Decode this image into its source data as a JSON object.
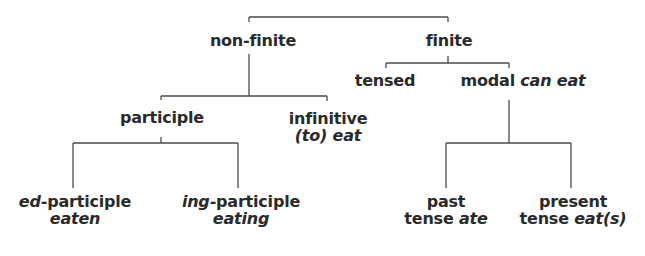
{
  "diagram": {
    "type": "tree",
    "title": "",
    "nodes": {
      "non_finite": {
        "label": "non-finite"
      },
      "finite": {
        "label": "finite"
      },
      "participle": {
        "label": "participle"
      },
      "infinitive": {
        "label": "infinitive",
        "example_prefix": "(to)",
        "example": "eat"
      },
      "ed_participle": {
        "label_italic": "ed",
        "label_rest": "-participle",
        "example": "eaten"
      },
      "ing_participle": {
        "label_italic": "ing",
        "label_rest": "-participle",
        "example": "eating"
      },
      "tensed": {
        "label": "tensed"
      },
      "modal": {
        "label": "modal",
        "example": "can eat"
      },
      "past": {
        "line1": "past",
        "line2": "tense",
        "example": "ate"
      },
      "present": {
        "line1": "present",
        "line2": "tense",
        "example": "eat(s)"
      }
    },
    "edges": [
      [
        "root",
        "non_finite"
      ],
      [
        "root",
        "finite"
      ],
      [
        "non_finite",
        "participle"
      ],
      [
        "non_finite",
        "infinitive"
      ],
      [
        "participle",
        "ed_participle"
      ],
      [
        "participle",
        "ing_participle"
      ],
      [
        "finite",
        "tensed"
      ],
      [
        "finite",
        "modal"
      ],
      [
        "modal",
        "past"
      ],
      [
        "modal",
        "present"
      ]
    ]
  }
}
